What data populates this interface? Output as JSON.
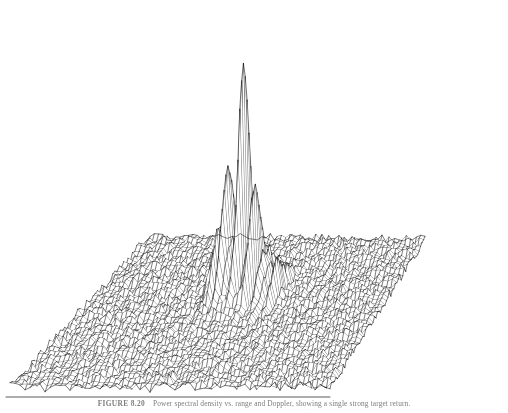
{
  "figure": {
    "label": "FIGURE 8.20",
    "caption_text": "Power spectral density vs. range and Doppler, showing a single strong target return.",
    "caption_full": "FIGURE 8.20   Power spectral density vs. range and Doppler, showing a single strong target return.",
    "background_color": "#ffffff",
    "ink_color": "#111111"
  },
  "chart_data": {
    "type": "surface",
    "title": "Power spectral density vs. range and Doppler",
    "subtitle": "",
    "xlabel": "",
    "ylabel": "",
    "zlabel": "",
    "grid": false,
    "legend": "none",
    "axis_ticks_visible": false,
    "projection": {
      "type": "parallel-oblique",
      "base_plane_corners_px": [
        [
          150,
          245
        ],
        [
          425,
          248
        ],
        [
          330,
          396
        ],
        [
          10,
          396
        ]
      ],
      "base_plane_order": "back-left, back-right, front-right, front-left"
    },
    "surface": {
      "rows": 64,
      "cols": 64,
      "noise_floor_level": 0.035,
      "noise_floor_roughness": 0.028,
      "noise_floor_units": "normalized power"
    },
    "peak": {
      "name": "target-return-peak",
      "apex_px": [
        240,
        12
      ],
      "apex_height_normalized": 1.0,
      "base_center_px": [
        243,
        300
      ],
      "half_width_cells": 3,
      "secondary_lobes": [
        {
          "offset_cells": -4,
          "height_normalized": 0.42
        },
        {
          "offset_cells": -2,
          "height_normalized": 0.63
        },
        {
          "offset_cells": 2,
          "height_normalized": 0.55
        },
        {
          "offset_cells": 4,
          "height_normalized": 0.3
        },
        {
          "offset_cells": 6,
          "height_normalized": 0.18
        }
      ]
    },
    "minor_peak": {
      "name": "front-edge-spike",
      "apex_px": [
        163,
        374
      ],
      "height_normalized": 0.06
    },
    "zlim": [
      0,
      1
    ],
    "z_values_note": "Heights are normalized to the single dominant peak; no numeric axis labels are printed on the figure."
  }
}
